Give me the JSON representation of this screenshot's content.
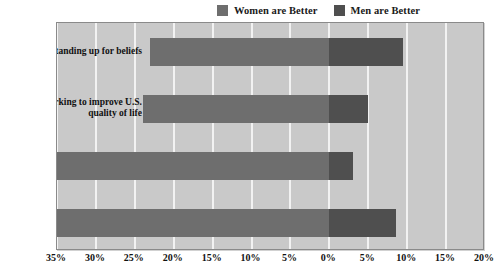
{
  "legend": {
    "items": [
      {
        "label": "Women are Better",
        "color": "#6e6e6e",
        "icon": "legend-swatch-icon"
      },
      {
        "label": "Men are Better",
        "color": "#4f4f4f",
        "icon": "legend-swatch-icon"
      }
    ]
  },
  "axis": {
    "ticks": [
      "35%",
      "30%",
      "25%",
      "20%",
      "15%",
      "10%",
      "5%",
      "0%",
      "5%",
      "10%",
      "15%",
      "20%"
    ]
  },
  "chart_data": {
    "type": "bar",
    "orientation": "horizontal",
    "style": "diverging",
    "title": "",
    "subtitle": "",
    "xlabel": "",
    "ylabel": "",
    "xlim": [
      -35,
      20
    ],
    "xticks": [
      -35,
      -30,
      -25,
      -20,
      -15,
      -10,
      -5,
      0,
      5,
      10,
      15,
      20
    ],
    "xticklabels": [
      "35%",
      "30%",
      "25%",
      "20%",
      "15%",
      "10%",
      "5%",
      "0%",
      "5%",
      "10%",
      "15%",
      "20%"
    ],
    "grid": true,
    "grid_axis": "x",
    "legend_position": "top-right",
    "categories": [
      "standing up for beliefs",
      "working to improve U.S.\nquality of life",
      "being honest and ethical",
      "working out compromises"
    ],
    "series": [
      {
        "name": "Women are Better",
        "color": "#6e6e6e",
        "values": [
          23,
          24,
          35,
          35
        ]
      },
      {
        "name": "Men are Better",
        "color": "#4f4f4f",
        "values": [
          9.5,
          5,
          3,
          8.5
        ]
      }
    ]
  },
  "rows": [
    {
      "label_line1": "standing up for beliefs",
      "label_line2": "",
      "women": 23,
      "men": 9.5
    },
    {
      "label_line1": "working to improve U.S.",
      "label_line2": "quality of life",
      "women": 24,
      "men": 5
    },
    {
      "label_line1": "being honest and ethical",
      "label_line2": "",
      "women": 35,
      "men": 3
    },
    {
      "label_line1": "working out compromises",
      "label_line2": "",
      "women": 35,
      "men": 8.5
    }
  ],
  "colors": {
    "women": "#6e6e6e",
    "men": "#4f4f4f",
    "plot_background": "#c9c9c9",
    "gridline": "#f2f2f2",
    "frame": "#8a8a8a"
  }
}
